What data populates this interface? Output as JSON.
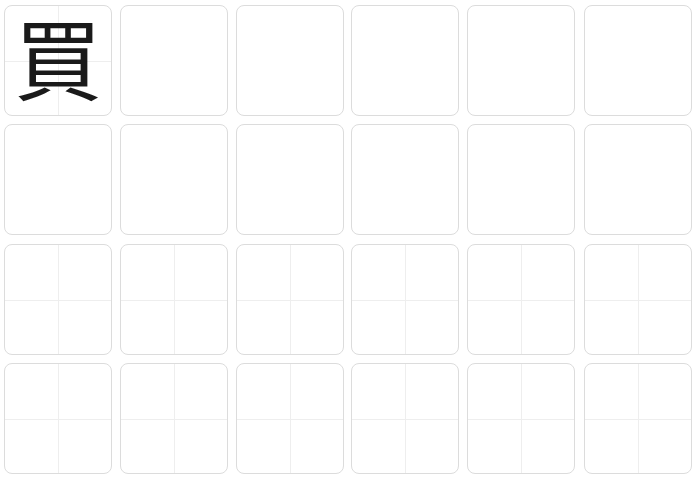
{
  "worksheet": {
    "title": "Character writing practice grid",
    "character": "買",
    "columns": 6,
    "rows": 4,
    "colors": {
      "border": "#dcdcdc",
      "guide": "#eeeeee",
      "ink": "#1a1a1a",
      "background": "#ffffff"
    },
    "grid_rows": [
      {
        "row": 1,
        "cells": [
          {
            "content": "買",
            "guides": true
          },
          {
            "content": "",
            "guides": false
          },
          {
            "content": "",
            "guides": false
          },
          {
            "content": "",
            "guides": false
          },
          {
            "content": "",
            "guides": false
          },
          {
            "content": "",
            "guides": false
          }
        ]
      },
      {
        "row": 2,
        "cells": [
          {
            "content": "",
            "guides": false
          },
          {
            "content": "",
            "guides": false
          },
          {
            "content": "",
            "guides": false
          },
          {
            "content": "",
            "guides": false
          },
          {
            "content": "",
            "guides": false
          },
          {
            "content": "",
            "guides": false
          }
        ]
      },
      {
        "row": 3,
        "cells": [
          {
            "content": "",
            "guides": true
          },
          {
            "content": "",
            "guides": true
          },
          {
            "content": "",
            "guides": true
          },
          {
            "content": "",
            "guides": true
          },
          {
            "content": "",
            "guides": true
          },
          {
            "content": "",
            "guides": true
          }
        ]
      },
      {
        "row": 4,
        "cells": [
          {
            "content": "",
            "guides": true
          },
          {
            "content": "",
            "guides": true
          },
          {
            "content": "",
            "guides": true
          },
          {
            "content": "",
            "guides": true
          },
          {
            "content": "",
            "guides": true
          },
          {
            "content": "",
            "guides": true
          }
        ]
      }
    ]
  }
}
